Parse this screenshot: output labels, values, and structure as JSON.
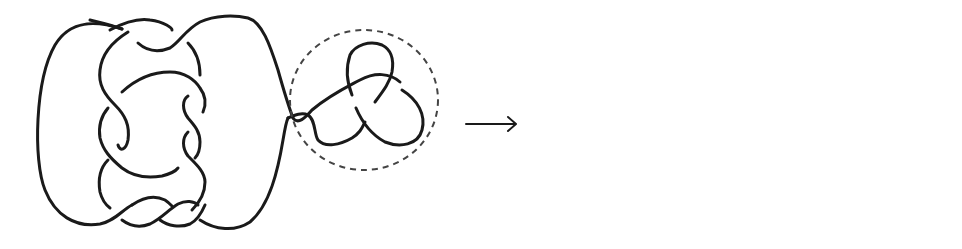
{
  "figure": {
    "description": "Knot diagram transformation: a knot with a circled trefoil summand (left) is transformed into an equivalent diagram where the trefoil tangle is slid along the strand (right).",
    "stroke_color": "#1a1a1a",
    "dash_color": "#444444",
    "background": "#ffffff"
  },
  "left_diagram": {
    "label": "Knot diagram with circled trefoil summand",
    "highlight": "dashed circle around trefoil"
  },
  "arrow": {
    "label": "transforms to",
    "glyph": "→"
  },
  "right_diagram": {
    "label": "Equivalent knot diagram with trefoil moved"
  }
}
